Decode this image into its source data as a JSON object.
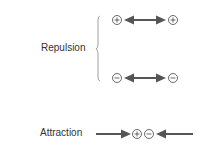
{
  "diagram": {
    "repulsion": {
      "label": "Repulsion",
      "rows": [
        {
          "left": "+",
          "right": "+",
          "arrow": "double"
        },
        {
          "left": "−",
          "right": "−",
          "arrow": "double"
        }
      ]
    },
    "attraction": {
      "label": "Attraction",
      "charges": [
        "+",
        "−"
      ],
      "arrows": "inward"
    },
    "colors": {
      "arrow": "#555555",
      "text": "#333333",
      "brace": "#888888"
    }
  }
}
